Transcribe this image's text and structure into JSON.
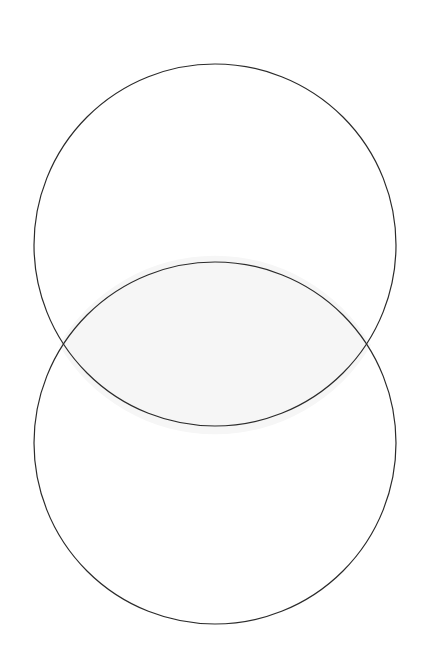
{
  "document": {
    "title": "Vesica Piscis",
    "background_color": "#ffffff",
    "width": 426,
    "height": 672
  },
  "diagram": {
    "type": "venn-two-set-vertical",
    "name": "two-overlapping-circles",
    "stroke_color": "#2b2b2b",
    "stroke_width": 1.2,
    "circle_fill": "none",
    "intersection_fill": "#f6f6f6",
    "shapes": {
      "upper_circle": {
        "label": "upper-circle",
        "cx": 215,
        "cy": 245,
        "r": 181,
        "top_y": 64,
        "bottom_y": 426,
        "left_x": 34,
        "right_x": 396
      },
      "lower_circle": {
        "label": "lower-circle",
        "cx": 215,
        "cy": 443,
        "r": 181,
        "top_y": 262,
        "bottom_y": 624,
        "left_x": 34,
        "right_x": 396
      },
      "intersection_lens": {
        "label": "intersection-lens",
        "left_vertex_x": 59,
        "left_vertex_y": 345,
        "right_vertex_x": 371,
        "right_vertex_y": 345,
        "top_vertex_x": 215,
        "top_vertex_y": 262,
        "bottom_vertex_x": 215,
        "bottom_vertex_y": 426,
        "path": "M 59 345 A 181 181 0 0 1 371 345 A 181 181 0 0 1 59 345"
      }
    },
    "center_offset_y": 198
  }
}
